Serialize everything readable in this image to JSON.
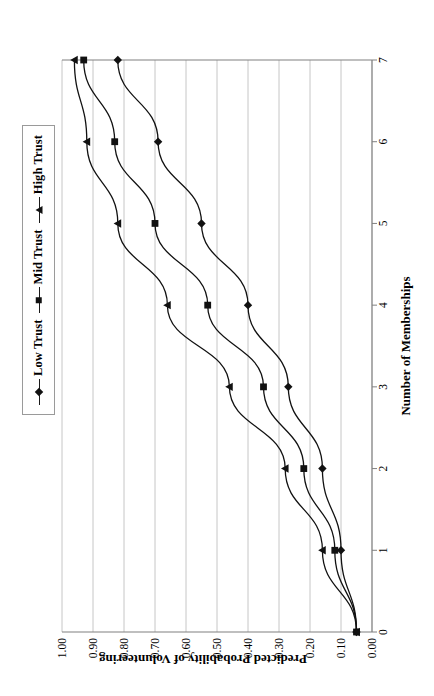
{
  "chart_data": {
    "type": "line",
    "title": "",
    "xlabel": "Number of Memberships",
    "ylabel": "Predicted Probability of Volunteering",
    "xlim": [
      0,
      7
    ],
    "ylim": [
      0.0,
      1.0
    ],
    "grid": "vertical-only",
    "legend_position": "top-left",
    "x": [
      0,
      1,
      2,
      3,
      4,
      5,
      6,
      7
    ],
    "xtick_labels": [
      "0",
      "1",
      "2",
      "3",
      "4",
      "5",
      "6",
      "7"
    ],
    "ytick_labels": [
      "0.00",
      "0.10",
      "0.20",
      "0.30",
      "0.40",
      "0.50",
      "0.60",
      "0.70",
      "0.80",
      "0.90",
      "1.00"
    ],
    "ytick_values": [
      0.0,
      0.1,
      0.2,
      0.3,
      0.4,
      0.5,
      0.6,
      0.7,
      0.8,
      0.9,
      1.0
    ],
    "series": [
      {
        "name": "Low Trust",
        "marker": "diamond",
        "color": "#111111",
        "values": [
          0.05,
          0.1,
          0.16,
          0.27,
          0.4,
          0.55,
          0.69,
          0.82
        ]
      },
      {
        "name": "Mid Trust",
        "marker": "square",
        "color": "#111111",
        "values": [
          0.05,
          0.12,
          0.22,
          0.35,
          0.53,
          0.7,
          0.83,
          0.93
        ]
      },
      {
        "name": "High Trust",
        "marker": "triangle",
        "color": "#111111",
        "values": [
          0.05,
          0.16,
          0.28,
          0.46,
          0.66,
          0.82,
          0.92,
          0.96
        ]
      }
    ]
  },
  "legend": {
    "entries": [
      {
        "label": "Low Trust",
        "marker": "diamond"
      },
      {
        "label": "Mid Trust",
        "marker": "square"
      },
      {
        "label": "High Trust",
        "marker": "triangle"
      }
    ]
  },
  "axes": {
    "x_title": "Number of Memberships",
    "y_title": "Predicted Probability of Volunteering"
  },
  "colors": {
    "line": "#1a1a1a",
    "gridline": "#bfbfbf",
    "axis": "#808080",
    "background": "#ffffff"
  }
}
